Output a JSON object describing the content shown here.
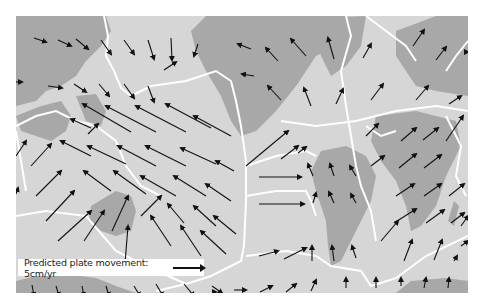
{
  "map": {
    "title": "Predicted plate movement world map",
    "colors": {
      "ocean": "#d6d6d6",
      "land": "#a8a8a8",
      "boundary": "#ffffff",
      "arrow": "#111111"
    },
    "legend": {
      "label": "Predicted plate movement: 5cm/yr",
      "arrow_length_px": 36
    },
    "plates": [
      "North American",
      "Pacific",
      "Eurasian",
      "South American",
      "African",
      "Indo-Australian",
      "Nazca",
      "Antarctic",
      "Cocos",
      "Caribbean",
      "Philippine",
      "Arabian"
    ]
  }
}
